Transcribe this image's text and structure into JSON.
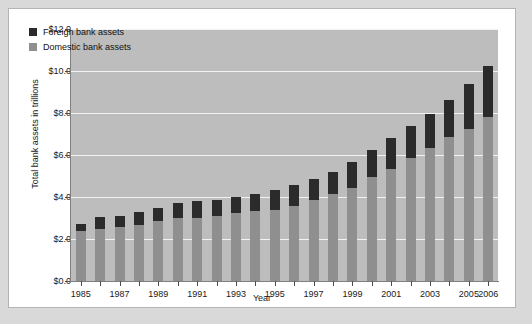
{
  "chart_data": {
    "type": "bar",
    "subtype": "stacked-bar",
    "title": "",
    "xlabel": "Year",
    "ylabel": "Total bank assets in trillions",
    "ylim": [
      0.0,
      12.0
    ],
    "ytick_values": [
      12.0,
      10.0,
      8.0,
      6.0,
      4.0,
      2.0,
      0.0
    ],
    "ytick_labels": [
      "$12.0",
      "$10.0",
      "$8.0",
      "$6.0",
      "$4.0",
      "$2.0",
      "$0.0"
    ],
    "grid": true,
    "legend_position": "upper-left-inside",
    "categories": [
      "1985",
      "1986",
      "1987",
      "1988",
      "1989",
      "1990",
      "1991",
      "1992",
      "1993",
      "1994",
      "1995",
      "1996",
      "1997",
      "1998",
      "1999",
      "2000",
      "2001",
      "2002",
      "2003",
      "2004",
      "2005",
      "2006"
    ],
    "xtick_labels": [
      "1985",
      "",
      "1987",
      "",
      "1989",
      "",
      "1991",
      "",
      "1993",
      "",
      "1995",
      "",
      "1997",
      "",
      "1999",
      "",
      "2001",
      "",
      "2003",
      "",
      "2005",
      "2006"
    ],
    "series": [
      {
        "name": "Domestic bank assets",
        "color": "#8f8f8f",
        "values": [
          2.4,
          2.5,
          2.55,
          2.65,
          2.85,
          3.0,
          3.0,
          3.1,
          3.25,
          3.35,
          3.4,
          3.55,
          3.85,
          4.15,
          4.45,
          4.95,
          5.35,
          5.85,
          6.35,
          6.85,
          7.25,
          7.8
        ]
      },
      {
        "name": "Foreign bank assets",
        "color": "#2b2b2b",
        "values": [
          0.3,
          0.55,
          0.55,
          0.65,
          0.65,
          0.7,
          0.8,
          0.75,
          0.75,
          0.8,
          0.95,
          1.0,
          1.0,
          1.05,
          1.2,
          1.3,
          1.45,
          1.55,
          1.6,
          1.75,
          2.15,
          2.45
        ]
      }
    ],
    "totals": [
      2.7,
      3.05,
      3.1,
      3.3,
      3.5,
      3.7,
      3.8,
      3.85,
      4.0,
      4.15,
      4.35,
      4.55,
      4.85,
      5.2,
      5.65,
      6.25,
      6.8,
      7.4,
      7.95,
      8.6,
      9.4,
      10.25
    ]
  },
  "legend": {
    "entries": [
      {
        "label": "Foreign bank assets",
        "color": "#2b2b2b"
      },
      {
        "label": "Domestic bank assets",
        "color": "#8f8f8f"
      }
    ]
  }
}
